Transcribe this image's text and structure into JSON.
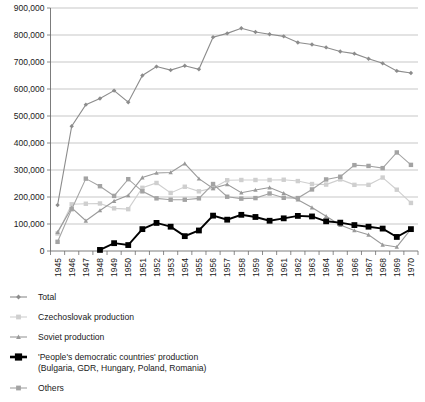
{
  "chart_data": {
    "type": "line",
    "title": "",
    "xlabel": "",
    "ylabel": "",
    "ylim": [
      0,
      900000
    ],
    "ytick_labels": [
      "0",
      "100,000",
      "200,000",
      "300,000",
      "400,000",
      "500,000",
      "600,000",
      "700,000",
      "800,000",
      "900,000"
    ],
    "ytick_values": [
      0,
      100000,
      200000,
      300000,
      400000,
      500000,
      600000,
      700000,
      800000,
      900000
    ],
    "grid": true,
    "legend_position": "below-plot",
    "categories": [
      "1945",
      "1946",
      "1947",
      "1948",
      "1949",
      "1950",
      "1951",
      "1952",
      "1953",
      "1954",
      "1955",
      "1956",
      "1957",
      "1958",
      "1959",
      "1960",
      "1961",
      "1962",
      "1963",
      "1964",
      "1965",
      "1966",
      "1967",
      "1968",
      "1969",
      "1970"
    ],
    "series": [
      {
        "name": "Total",
        "marker": "diamond",
        "color": "#8c8c8c",
        "values": [
          170000,
          462000,
          542000,
          565000,
          594000,
          551000,
          650000,
          683000,
          670000,
          686000,
          673000,
          792000,
          806000,
          825000,
          811000,
          803000,
          795000,
          772000,
          765000,
          754000,
          739000,
          731000,
          712000,
          695000,
          667000,
          659000
        ]
      },
      {
        "name": "Czechoslovak production",
        "marker": "square",
        "color": "#cfcfcf",
        "values": [
          65000,
          173000,
          175000,
          176000,
          158000,
          155000,
          234000,
          252000,
          215000,
          238000,
          221000,
          233000,
          262000,
          263000,
          263000,
          263000,
          264000,
          259000,
          248000,
          246000,
          265000,
          245000,
          245000,
          272000,
          227000,
          178000
        ]
      },
      {
        "name": "Soviet production",
        "marker": "triangle",
        "color": "#9a9a9a",
        "values": [
          70000,
          160000,
          112000,
          150000,
          185000,
          206000,
          272000,
          289000,
          291000,
          324000,
          268000,
          232000,
          247000,
          216000,
          226000,
          235000,
          214000,
          190000,
          161000,
          129000,
          96000,
          76000,
          60000,
          23000,
          15000,
          81000
        ]
      },
      {
        "name": "'People's democratic countries' production (Bulgaria, GDR, Hungary, Poland, Romania)",
        "marker": "square",
        "color": "#000000",
        "values": [
          null,
          null,
          null,
          4000,
          29000,
          22000,
          81000,
          104000,
          90000,
          55000,
          76000,
          131000,
          116000,
          134000,
          126000,
          112000,
          121000,
          130000,
          128000,
          110000,
          105000,
          96000,
          90000,
          83000,
          52000,
          81000
        ]
      },
      {
        "name": "Others",
        "marker": "square",
        "color": "#a3a3a3",
        "values": [
          34000,
          155000,
          268000,
          240000,
          204000,
          266000,
          221000,
          195000,
          190000,
          190000,
          195000,
          248000,
          201000,
          194000,
          196000,
          213000,
          197000,
          196000,
          228000,
          265000,
          275000,
          318000,
          315000,
          307000,
          365000,
          319000
        ]
      }
    ]
  },
  "legend": {
    "items": [
      {
        "label": "Total",
        "marker": "diamond-marker",
        "color": "#8c8c8c"
      },
      {
        "label": "Czechoslovak production",
        "marker": "square-marker",
        "color": "#cfcfcf"
      },
      {
        "label": "Soviet production",
        "marker": "triangle-marker",
        "color": "#9a9a9a"
      },
      {
        "label": "'People's democratic countries' production",
        "label_line2": "(Bulgaria, GDR, Hungary, Poland, Romania)",
        "marker": "square-marker",
        "color": "#000000"
      },
      {
        "label": "Others",
        "marker": "square-marker",
        "color": "#a3a3a3"
      }
    ]
  },
  "colors": {
    "gridline": "#b0b0b0",
    "axis": "#6d6d6d",
    "background": "#ffffff",
    "text": "#1a1a1a"
  }
}
